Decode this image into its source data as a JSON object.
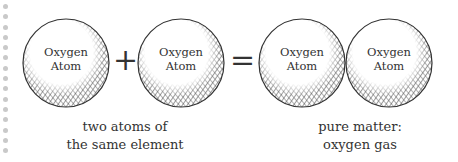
{
  "diagram": {
    "atoms": [
      {
        "label_line1": "Oxygen",
        "label_line2": "Atom"
      },
      {
        "label_line1": "Oxygen",
        "label_line2": "Atom"
      },
      {
        "label_line1": "Oxygen",
        "label_line2": "Atom"
      },
      {
        "label_line1": "Oxygen",
        "label_line2": "Atom"
      }
    ],
    "operators": {
      "plus": "+",
      "equals": "="
    },
    "captions": {
      "left": {
        "line1": "two atoms of",
        "line2": "the same element"
      },
      "right": {
        "line1": "pure matter:",
        "line2": "oxygen gas"
      }
    },
    "colors": {
      "ink": "#333333",
      "hatch": "#555555",
      "dots": "#c9c9c9",
      "background": "#ffffff"
    }
  }
}
